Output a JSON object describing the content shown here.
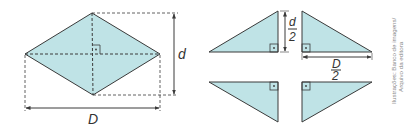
{
  "diagram": {
    "colors": {
      "fill": "#bfe3e6",
      "stroke": "#3a3a3a",
      "dash": "#3a3a3a",
      "label": "#333333",
      "credit": "#888888"
    },
    "rhombus": {
      "labels": {
        "major_diagonal": "D",
        "minor_diagonal": "d"
      }
    },
    "triangles": {
      "labels": {
        "half_minor_num": "d",
        "half_minor_den": "2",
        "half_major_num": "D",
        "half_major_den": "2"
      }
    },
    "credit": {
      "line1": "Ilustrações: Banco de imagens/",
      "line2": "Arquivo da editora"
    }
  }
}
